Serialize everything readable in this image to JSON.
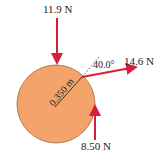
{
  "diagram": {
    "type": "free-body force diagram on a disk",
    "colors": {
      "disk_fill": "#F4A46A",
      "disk_stroke": "#A0643A",
      "arrow": "#D81E3C",
      "text": "#222222"
    },
    "forces": [
      {
        "label": "11.9 N",
        "direction": "down",
        "applied_at": "top of disk"
      },
      {
        "label": "14.6 N",
        "direction": "right, slightly up",
        "applied_at": "rim, upper right"
      },
      {
        "label": "8.50 N",
        "direction": "up",
        "applied_at": "right side of disk"
      }
    ],
    "angle_label": "40.0°",
    "radius_label": "0.350 m"
  }
}
